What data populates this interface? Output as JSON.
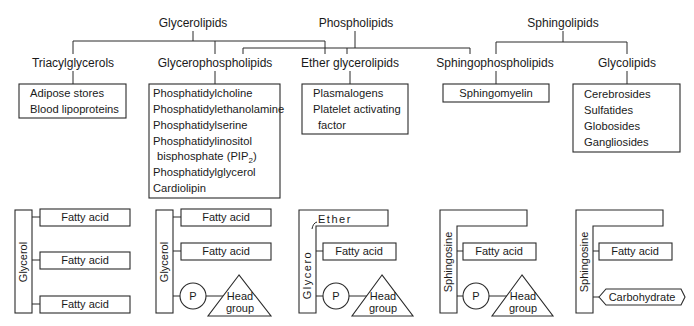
{
  "categories": {
    "glycerolipids": "Glycerolipids",
    "phospholipids": "Phospholipids",
    "sphingolipids": "Sphingolipids"
  },
  "subclasses": [
    {
      "label": "Triacylglycerols",
      "examples": [
        "Adipose stores",
        "Blood lipoproteins"
      ]
    },
    {
      "label": "Glycerophospholipids",
      "examples": [
        "Phosphatidylcholine",
        "Phosphatidylethanolamine",
        "Phosphatidylserine",
        "Phosphatidylinositol",
        "bisphosphate (PIP",
        "Phosphatidylglycerol",
        "Cardiolipin"
      ],
      "subscript": "2",
      "subscript_close": ")"
    },
    {
      "label": "Ether glycerolipids",
      "examples": [
        "Plasmalogens",
        "Platelet activating",
        "factor"
      ]
    },
    {
      "label": "Sphingophospholipids",
      "examples": [
        "Sphingomyelin"
      ]
    },
    {
      "label": "Glycolipids",
      "examples": [
        "Cerebrosides",
        "Sulfatides",
        "Globosides",
        "Gangliosides"
      ]
    }
  ],
  "structures": {
    "triacylglycerol": {
      "backbone": "Glycerol",
      "chains": [
        "Fatty acid",
        "Fatty acid",
        "Fatty acid"
      ]
    },
    "glycerophospholipid": {
      "backbone": "Glycerol",
      "chains": [
        "Fatty acid",
        "Fatty acid"
      ],
      "phosphate": "P",
      "head": [
        "Head",
        "group"
      ]
    },
    "ether_glycerolipid": {
      "backbone": "Glycero",
      "ether": "Ether",
      "chains": [
        "Fatty acid"
      ],
      "phosphate": "P",
      "head": [
        "Head",
        "group"
      ]
    },
    "sphingophospholipid": {
      "backbone": "Sphingosine",
      "chains": [
        "Fatty acid"
      ],
      "phosphate": "P",
      "head": [
        "Head",
        "group"
      ]
    },
    "glycolipid": {
      "backbone": "Sphingosine",
      "chains": [
        "Fatty acid"
      ],
      "carbohydrate": "Carbohydrate"
    }
  }
}
